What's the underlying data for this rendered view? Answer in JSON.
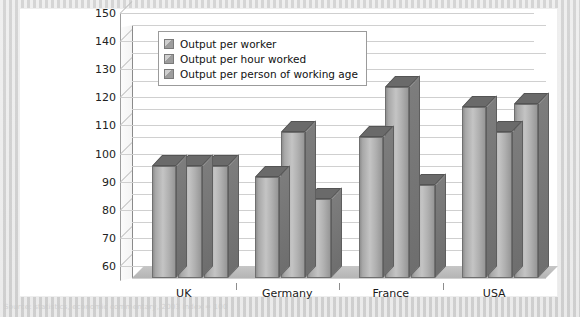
{
  "chart_data": {
    "type": "bar",
    "title": "",
    "subtitle": "",
    "xlabel": "",
    "ylabel": "",
    "categories": [
      "UK",
      "Germany",
      "France",
      "USA"
    ],
    "series": [
      {
        "name": "Output per worker",
        "values": [
          100,
          96,
          110,
          121
        ]
      },
      {
        "name": "Output per hour worked",
        "values": [
          100,
          112,
          128,
          112
        ]
      },
      {
        "name": "Output per person of working age",
        "values": [
          100,
          88,
          93,
          122
        ]
      }
    ],
    "ylim": [
      60,
      150
    ],
    "ytick_step": 10,
    "yticks": [
      150,
      140,
      130,
      120,
      110,
      100,
      90,
      80,
      70,
      60
    ],
    "grid": true,
    "legend_position": "top-left-inside",
    "style": "3d-column-grayscale"
  },
  "legend": {
    "items": [
      {
        "label": "Output per worker",
        "color": "#a6a6a6"
      },
      {
        "label": "Output per hour worked",
        "color": "#a6a6a6"
      },
      {
        "label": "Output per person of working age",
        "color": "#a6a6a6"
      }
    ]
  },
  "caption": {
    "watermark_text": "Source: statistics, economic commentary, 2003 index = 100"
  },
  "colors": {
    "page_background": "#d8d8d8",
    "chart_background": "#ffffff",
    "gridline": "#d0d0d0",
    "axis": "#8a8a8a",
    "bar_front": "#b4b4b4",
    "bar_side": "#757575",
    "bar_top": "#6a6a6a",
    "text": "#1a1a1a"
  }
}
